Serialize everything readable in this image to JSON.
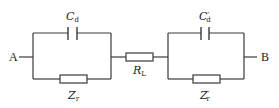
{
  "diagram": {
    "type": "circuit",
    "nodes": {
      "left": "A",
      "right": "B"
    },
    "components": {
      "left_capacitor": {
        "symbol": "C",
        "subscript": "d",
        "prime": ""
      },
      "left_resistor": {
        "symbol": "Z",
        "subscript": "r",
        "prime": ""
      },
      "series_resistor": {
        "symbol": "R",
        "subscript": "L",
        "prime": ""
      },
      "right_capacitor": {
        "symbol": "C",
        "subscript": "d",
        "prime": "′"
      },
      "right_resistor": {
        "symbol": "Z",
        "subscript": "r",
        "prime": "′"
      }
    },
    "colors": {
      "line": "#3a3a3a",
      "text": "#222222",
      "background": "#ffffff"
    }
  }
}
